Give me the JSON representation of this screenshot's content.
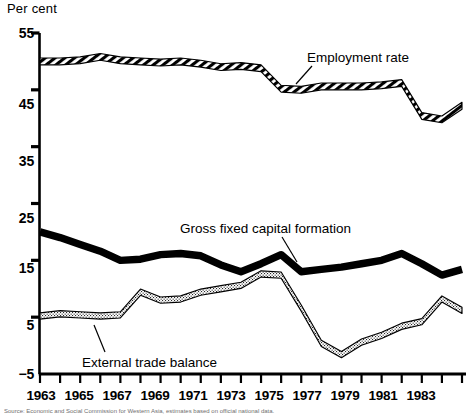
{
  "chart_data": {
    "type": "line",
    "title": "",
    "ylabel": "Per cent",
    "xlabel": "",
    "ylim": [
      -5,
      55
    ],
    "xlim": [
      1963,
      1984
    ],
    "yticks": [
      55,
      45,
      35,
      25,
      15,
      5,
      -5
    ],
    "ytick_labels": [
      "55",
      "45",
      "35",
      "25",
      "15",
      "5",
      "−5"
    ],
    "xticks": [
      1963,
      1964,
      1965,
      1966,
      1967,
      1968,
      1969,
      1970,
      1971,
      1972,
      1973,
      1974,
      1975,
      1976,
      1977,
      1978,
      1979,
      1980,
      1981,
      1982,
      1983,
      1984
    ],
    "xtick_labels": [
      "1963",
      "1965",
      "1967",
      "1969",
      "1971",
      "1973",
      "1975",
      "1977",
      "1979",
      "1981",
      "1983"
    ],
    "xtick_labelled_years": [
      1963,
      1965,
      1967,
      1969,
      1971,
      1973,
      1975,
      1977,
      1979,
      1981,
      1983
    ],
    "grid": false,
    "legend_position": "inline-annotations",
    "x": [
      1963,
      1964,
      1965,
      1966,
      1967,
      1968,
      1969,
      1970,
      1971,
      1972,
      1973,
      1974,
      1975,
      1976,
      1977,
      1978,
      1979,
      1980,
      1981,
      1982,
      1983,
      1984
    ],
    "series": [
      {
        "name": "Employment rate",
        "style": "hatched-band",
        "color": "#000000",
        "values": [
          50.0,
          50.0,
          50.2,
          50.8,
          50.2,
          50.0,
          49.8,
          50.0,
          49.6,
          49.0,
          49.2,
          48.8,
          45.2,
          45.0,
          45.6,
          45.6,
          45.6,
          45.8,
          46.2,
          40.4,
          39.8,
          42.2
        ]
      },
      {
        "name": "Gross fixed capital formation",
        "style": "solid-band",
        "color": "#000000",
        "values": [
          20.0,
          19.0,
          17.8,
          16.6,
          15.0,
          15.2,
          16.0,
          16.2,
          15.8,
          14.2,
          13.0,
          14.4,
          16.0,
          13.0,
          13.4,
          13.8,
          14.4,
          15.0,
          16.2,
          14.4,
          12.4,
          13.4
        ]
      },
      {
        "name": "External trade balance",
        "style": "stippled-band",
        "color": "#000000",
        "values": [
          5.2,
          5.6,
          5.4,
          5.2,
          5.4,
          9.4,
          8.0,
          8.2,
          9.4,
          10.0,
          10.6,
          12.6,
          12.4,
          6.6,
          0.4,
          -1.6,
          0.6,
          1.8,
          3.4,
          4.2,
          8.2,
          6.2
        ]
      }
    ],
    "annotations": [
      {
        "text": "Employment rate",
        "series": "Employment rate"
      },
      {
        "text": "Gross fixed capital formation",
        "series": "Gross fixed capital formation"
      },
      {
        "text": "External trade balance",
        "series": "External trade balance"
      }
    ]
  },
  "labels": {
    "y_axis_title": "Per cent",
    "employment_rate": "Employment rate",
    "gross_fixed_capital_formation": "Gross fixed capital formation",
    "external_trade_balance": "External trade balance"
  },
  "footnote": {
    "text": "Source: Economic and Social Commission for Western Asia, estimates based on official national data."
  },
  "colors": {
    "ink": "#000000",
    "background": "#ffffff"
  }
}
